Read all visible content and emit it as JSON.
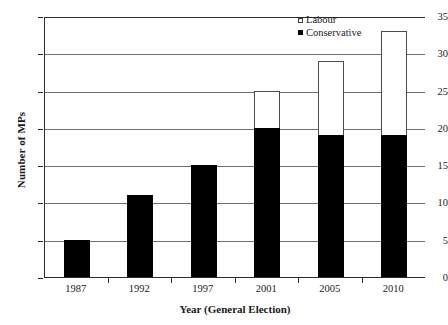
{
  "chart_data": {
    "type": "bar",
    "title": "",
    "subtitle": "",
    "xlabel": "Year (General Election)",
    "ylabel": "Number of MPs",
    "categories": [
      "1987",
      "1992",
      "1997",
      "2001",
      "2005",
      "2010"
    ],
    "series": [
      {
        "name": "Conservative",
        "color": "#000000",
        "values": [
          5,
          11,
          15,
          20,
          19,
          19
        ]
      },
      {
        "name": "Labour",
        "color": "#ffffff",
        "values": [
          0,
          0,
          0,
          5,
          10,
          14
        ]
      }
    ],
    "totals": [
      5,
      11,
      15,
      25,
      29,
      33
    ],
    "stacked": true,
    "ylim": [
      0,
      35
    ],
    "yticks": [
      0,
      5,
      10,
      15,
      20,
      25,
      30,
      35
    ],
    "ytick_labels": [
      "0",
      "5",
      "10",
      "15",
      "20",
      "25",
      "30",
      "35"
    ],
    "grid": "horizontal",
    "legend_position": "top-right",
    "legend": [
      {
        "label": "Labour",
        "swatch": "hollow-square"
      },
      {
        "label": "Conservative",
        "swatch": "filled-square"
      }
    ]
  }
}
